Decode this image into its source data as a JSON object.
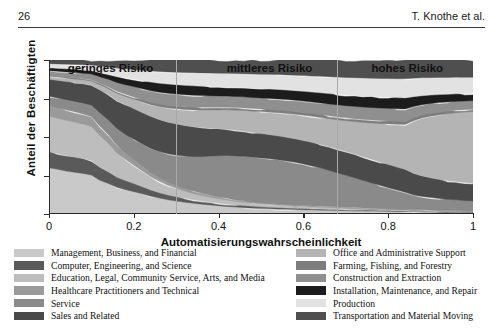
{
  "runhead": {
    "page_number": "26",
    "authors": "T. Knothe et al."
  },
  "figure": {
    "ylabel": "Anteil der Beschäftigten",
    "xlabel": "Automatisierungswahrscheinlichkeit",
    "regions": [
      {
        "label": "geringes Risiko",
        "center_x": 0.145
      },
      {
        "label": "mittleres Risiko",
        "center_x": 0.52
      },
      {
        "label": "hohes Risiko",
        "center_x": 0.845
      }
    ],
    "dividers": [
      0.3,
      0.68
    ]
  },
  "legend": {
    "left": [
      {
        "label": "Management, Business, and Financial",
        "color": "#c9c9c9"
      },
      {
        "label": "Computer, Engineering, and Science",
        "color": "#5a5a5a"
      },
      {
        "label": "Education, Legal, Community Service, Arts, and Media",
        "color": "#bdbdbd"
      },
      {
        "label": "Healthcare Practitioners and Technical",
        "color": "#9a9a9a"
      },
      {
        "label": "Service",
        "color": "#8a8a8a"
      },
      {
        "label": "Sales and Related",
        "color": "#4a4a4a"
      }
    ],
    "right": [
      {
        "label": "Office and Administrative Support",
        "color": "#b4b4b4"
      },
      {
        "label": "Farming, Fishing, and Forestry",
        "color": "#7d7d7d"
      },
      {
        "label": "Construction and Extraction",
        "color": "#8f8f8f"
      },
      {
        "label": "Installation, Maintenance, and Repair",
        "color": "#1c1c1c"
      },
      {
        "label": "Production",
        "color": "#e2e2e2"
      },
      {
        "label": "Transportation and Material Moving",
        "color": "#4f4f4f"
      }
    ]
  },
  "chart_data": {
    "type": "area",
    "stacked": true,
    "title": "",
    "xlabel": "Automatisierungswahrscheinlichkeit",
    "ylabel": "Anteil der Beschäftigten",
    "xlim": [
      0,
      1
    ],
    "ylim": [
      0,
      1
    ],
    "xticks": [
      "0",
      "0.2",
      "0.4",
      "0.6",
      "0.8",
      "1"
    ],
    "xtick_values": [
      0,
      0.2,
      0.4,
      0.6,
      0.8,
      1
    ],
    "yticks": [],
    "grid": false,
    "legend_position": "below",
    "x": [
      0.0,
      0.02,
      0.04,
      0.06,
      0.08,
      0.1,
      0.12,
      0.14,
      0.16,
      0.18,
      0.2,
      0.22,
      0.24,
      0.26,
      0.28,
      0.3,
      0.32,
      0.34,
      0.36,
      0.38,
      0.4,
      0.42,
      0.44,
      0.46,
      0.48,
      0.5,
      0.52,
      0.54,
      0.56,
      0.58,
      0.6,
      0.62,
      0.64,
      0.66,
      0.68,
      0.7,
      0.72,
      0.74,
      0.76,
      0.78,
      0.8,
      0.82,
      0.84,
      0.86,
      0.88,
      0.9,
      0.92,
      0.94,
      0.96,
      0.98,
      1.0
    ],
    "series": [
      {
        "name": "Management, Business, and Financial",
        "color": "#c9c9c9",
        "values": [
          0.3,
          0.285,
          0.27,
          0.26,
          0.25,
          0.235,
          0.18,
          0.15,
          0.12,
          0.105,
          0.095,
          0.085,
          0.075,
          0.068,
          0.062,
          0.058,
          0.055,
          0.052,
          0.05,
          0.048,
          0.046,
          0.044,
          0.042,
          0.04,
          0.038,
          0.036,
          0.035,
          0.034,
          0.033,
          0.032,
          0.031,
          0.03,
          0.029,
          0.028,
          0.027,
          0.026,
          0.025,
          0.024,
          0.023,
          0.022,
          0.021,
          0.02,
          0.019,
          0.018,
          0.017,
          0.016,
          0.015,
          0.014,
          0.013,
          0.012,
          0.011
        ]
      },
      {
        "name": "Computer, Engineering, and Science",
        "color": "#5a5a5a",
        "values": [
          0.105,
          0.1,
          0.098,
          0.095,
          0.092,
          0.088,
          0.07,
          0.058,
          0.046,
          0.04,
          0.034,
          0.03,
          0.026,
          0.023,
          0.021,
          0.019,
          0.018,
          0.017,
          0.016,
          0.015,
          0.015,
          0.014,
          0.013,
          0.013,
          0.012,
          0.012,
          0.011,
          0.011,
          0.01,
          0.01,
          0.01,
          0.009,
          0.009,
          0.009,
          0.008,
          0.008,
          0.008,
          0.007,
          0.007,
          0.007,
          0.006,
          0.006,
          0.006,
          0.005,
          0.005,
          0.005,
          0.004,
          0.004,
          0.004,
          0.003,
          0.003
        ]
      },
      {
        "name": "Education, Legal, Community Service, Arts, and Media",
        "color": "#bdbdbd",
        "values": [
          0.23,
          0.225,
          0.222,
          0.218,
          0.212,
          0.205,
          0.17,
          0.14,
          0.11,
          0.092,
          0.078,
          0.066,
          0.056,
          0.048,
          0.042,
          0.038,
          0.034,
          0.031,
          0.029,
          0.027,
          0.025,
          0.024,
          0.022,
          0.021,
          0.02,
          0.019,
          0.018,
          0.017,
          0.016,
          0.016,
          0.015,
          0.014,
          0.014,
          0.013,
          0.013,
          0.012,
          0.012,
          0.011,
          0.011,
          0.01,
          0.01,
          0.009,
          0.009,
          0.008,
          0.008,
          0.007,
          0.007,
          0.006,
          0.006,
          0.005,
          0.005
        ]
      },
      {
        "name": "Healthcare Practitioners and Technical",
        "color": "#9a9a9a",
        "values": [
          0.07,
          0.068,
          0.066,
          0.064,
          0.062,
          0.06,
          0.05,
          0.042,
          0.034,
          0.029,
          0.025,
          0.022,
          0.019,
          0.017,
          0.015,
          0.014,
          0.013,
          0.012,
          0.011,
          0.011,
          0.01,
          0.01,
          0.009,
          0.009,
          0.008,
          0.008,
          0.008,
          0.007,
          0.007,
          0.007,
          0.006,
          0.006,
          0.006,
          0.006,
          0.005,
          0.005,
          0.005,
          0.005,
          0.004,
          0.004,
          0.004,
          0.004,
          0.003,
          0.003,
          0.003,
          0.003,
          0.002,
          0.002,
          0.002,
          0.002,
          0.002
        ]
      },
      {
        "name": "Service",
        "color": "#8a8a8a",
        "values": [
          0.06,
          0.062,
          0.064,
          0.066,
          0.068,
          0.07,
          0.072,
          0.074,
          0.076,
          0.08,
          0.085,
          0.092,
          0.1,
          0.11,
          0.122,
          0.135,
          0.15,
          0.168,
          0.188,
          0.21,
          0.232,
          0.252,
          0.268,
          0.28,
          0.29,
          0.298,
          0.305,
          0.31,
          0.312,
          0.31,
          0.305,
          0.298,
          0.288,
          0.275,
          0.262,
          0.248,
          0.234,
          0.22,
          0.206,
          0.192,
          0.178,
          0.165,
          0.15,
          0.12,
          0.105,
          0.095,
          0.088,
          0.082,
          0.078,
          0.074,
          0.07
        ]
      },
      {
        "name": "Sales and Related",
        "color": "#4a4a4a",
        "values": [
          0.11,
          0.112,
          0.114,
          0.116,
          0.118,
          0.12,
          0.122,
          0.124,
          0.126,
          0.128,
          0.13,
          0.132,
          0.134,
          0.136,
          0.138,
          0.14,
          0.142,
          0.145,
          0.148,
          0.15,
          0.152,
          0.154,
          0.156,
          0.158,
          0.16,
          0.162,
          0.164,
          0.166,
          0.168,
          0.17,
          0.172,
          0.174,
          0.176,
          0.178,
          0.18,
          0.182,
          0.184,
          0.186,
          0.188,
          0.19,
          0.192,
          0.194,
          0.196,
          0.175,
          0.16,
          0.15,
          0.142,
          0.136,
          0.132,
          0.128,
          0.124
        ]
      },
      {
        "name": "Office and Administrative Support",
        "color": "#b4b4b4",
        "values": [
          0.02,
          0.021,
          0.022,
          0.023,
          0.024,
          0.025,
          0.027,
          0.029,
          0.032,
          0.036,
          0.04,
          0.045,
          0.05,
          0.056,
          0.062,
          0.068,
          0.075,
          0.082,
          0.09,
          0.098,
          0.106,
          0.114,
          0.122,
          0.13,
          0.138,
          0.146,
          0.154,
          0.162,
          0.17,
          0.178,
          0.186,
          0.194,
          0.202,
          0.212,
          0.224,
          0.238,
          0.254,
          0.272,
          0.292,
          0.314,
          0.338,
          0.362,
          0.386,
          0.43,
          0.455,
          0.472,
          0.484,
          0.492,
          0.498,
          0.502,
          0.505
        ]
      },
      {
        "name": "Farming, Fishing, and Forestry",
        "color": "#7d7d7d",
        "values": [
          0.006,
          0.006,
          0.006,
          0.007,
          0.007,
          0.007,
          0.008,
          0.008,
          0.009,
          0.009,
          0.01,
          0.01,
          0.011,
          0.011,
          0.012,
          0.012,
          0.013,
          0.013,
          0.014,
          0.014,
          0.015,
          0.015,
          0.016,
          0.016,
          0.017,
          0.017,
          0.018,
          0.018,
          0.019,
          0.019,
          0.02,
          0.02,
          0.021,
          0.021,
          0.022,
          0.022,
          0.023,
          0.023,
          0.024,
          0.024,
          0.025,
          0.025,
          0.026,
          0.024,
          0.022,
          0.021,
          0.02,
          0.019,
          0.018,
          0.017,
          0.016
        ]
      },
      {
        "name": "Construction and Extraction",
        "color": "#8f8f8f",
        "values": [
          0.03,
          0.031,
          0.032,
          0.033,
          0.034,
          0.035,
          0.036,
          0.038,
          0.04,
          0.042,
          0.044,
          0.046,
          0.048,
          0.05,
          0.052,
          0.054,
          0.056,
          0.058,
          0.06,
          0.062,
          0.064,
          0.066,
          0.068,
          0.07,
          0.072,
          0.074,
          0.076,
          0.078,
          0.08,
          0.082,
          0.084,
          0.086,
          0.088,
          0.09,
          0.092,
          0.094,
          0.096,
          0.098,
          0.1,
          0.102,
          0.104,
          0.106,
          0.108,
          0.092,
          0.082,
          0.076,
          0.072,
          0.068,
          0.065,
          0.062,
          0.06
        ]
      },
      {
        "name": "Installation, Maintenance, and Repair",
        "color": "#1c1c1c",
        "values": [
          0.018,
          0.019,
          0.02,
          0.021,
          0.022,
          0.023,
          0.024,
          0.026,
          0.028,
          0.03,
          0.032,
          0.034,
          0.036,
          0.038,
          0.04,
          0.042,
          0.044,
          0.046,
          0.048,
          0.05,
          0.052,
          0.054,
          0.056,
          0.058,
          0.06,
          0.062,
          0.064,
          0.066,
          0.068,
          0.07,
          0.072,
          0.074,
          0.076,
          0.078,
          0.08,
          0.082,
          0.084,
          0.086,
          0.088,
          0.09,
          0.092,
          0.094,
          0.096,
          0.08,
          0.07,
          0.064,
          0.06,
          0.057,
          0.054,
          0.052,
          0.05
        ]
      },
      {
        "name": "Production",
        "color": "#e2e2e2",
        "values": [
          0.026,
          0.027,
          0.028,
          0.029,
          0.03,
          0.031,
          0.033,
          0.035,
          0.037,
          0.039,
          0.041,
          0.044,
          0.047,
          0.05,
          0.053,
          0.056,
          0.06,
          0.064,
          0.068,
          0.072,
          0.076,
          0.08,
          0.084,
          0.088,
          0.092,
          0.096,
          0.1,
          0.104,
          0.108,
          0.112,
          0.116,
          0.12,
          0.124,
          0.128,
          0.132,
          0.136,
          0.14,
          0.144,
          0.148,
          0.152,
          0.156,
          0.16,
          0.164,
          0.15,
          0.14,
          0.133,
          0.128,
          0.124,
          0.12,
          0.117,
          0.114
        ]
      },
      {
        "name": "Transportation and Material Moving",
        "color": "#4f4f4f",
        "values": [
          0.025,
          0.026,
          0.027,
          0.028,
          0.029,
          0.03,
          0.032,
          0.034,
          0.036,
          0.038,
          0.04,
          0.043,
          0.046,
          0.049,
          0.052,
          0.055,
          0.058,
          0.062,
          0.066,
          0.07,
          0.074,
          0.078,
          0.082,
          0.086,
          0.09,
          0.094,
          0.098,
          0.102,
          0.106,
          0.11,
          0.114,
          0.118,
          0.122,
          0.126,
          0.13,
          0.134,
          0.138,
          0.142,
          0.146,
          0.15,
          0.154,
          0.158,
          0.162,
          0.148,
          0.14,
          0.135,
          0.131,
          0.128,
          0.125,
          0.123,
          0.121
        ]
      }
    ]
  }
}
